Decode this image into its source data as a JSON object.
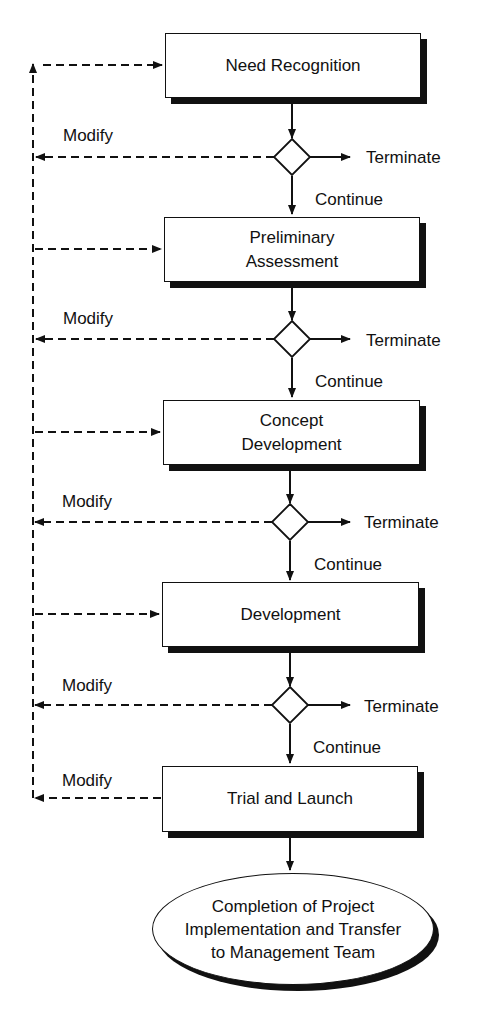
{
  "diagram": {
    "type": "flowchart",
    "stages": [
      {
        "id": "s1",
        "label": "Need Recognition"
      },
      {
        "id": "s2",
        "label": "Preliminary Assessment",
        "lines": [
          "Preliminary",
          "Assessment"
        ]
      },
      {
        "id": "s3",
        "label": "Concept Development",
        "lines": [
          "Concept",
          "Development"
        ]
      },
      {
        "id": "s4",
        "label": "Development"
      },
      {
        "id": "s5",
        "label": "Trial and Launch"
      }
    ],
    "decisions": [
      {
        "id": "d1",
        "modify_label": "Modify",
        "terminate_label": "Terminate",
        "continue_label": "Continue"
      },
      {
        "id": "d2",
        "modify_label": "Modify",
        "terminate_label": "Terminate",
        "continue_label": "Continue"
      },
      {
        "id": "d3",
        "modify_label": "Modify",
        "terminate_label": "Terminate",
        "continue_label": "Continue"
      },
      {
        "id": "d4",
        "modify_label": "Modify",
        "terminate_label": "Terminate",
        "continue_label": "Continue"
      }
    ],
    "final_modify_label": "Modify",
    "end": {
      "label": "Completion of Project Implementation and Transfer to Management Team",
      "lines": [
        "Completion of Project",
        "Implementation and Transfer",
        "to Management Team"
      ]
    },
    "colors": {
      "stroke": "#111111",
      "background": "#ffffff"
    }
  }
}
